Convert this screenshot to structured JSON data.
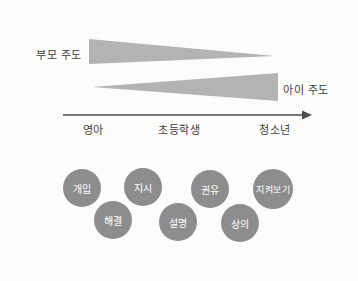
{
  "diagram": {
    "title_hint": "parent-led vs child-led guidance diagram",
    "top_label": "부모 주도",
    "bottom_label": "아이 주도",
    "stages": [
      {
        "label": "영아"
      },
      {
        "label": "초등학생"
      },
      {
        "label": "청소년"
      }
    ],
    "colors": {
      "triangle": "#b3b3b3",
      "axis": "#4d4d4d",
      "text": "#3d3d3d",
      "bubble": "#8d8d8d",
      "bubble_text": "#ffffff",
      "background": "#fcfcfb"
    }
  },
  "bubbles": [
    {
      "label": "개입"
    },
    {
      "label": "지시"
    },
    {
      "label": "권유"
    },
    {
      "label": "지켜보기"
    },
    {
      "label": "해결"
    },
    {
      "label": "설명"
    },
    {
      "label": "상의"
    }
  ]
}
